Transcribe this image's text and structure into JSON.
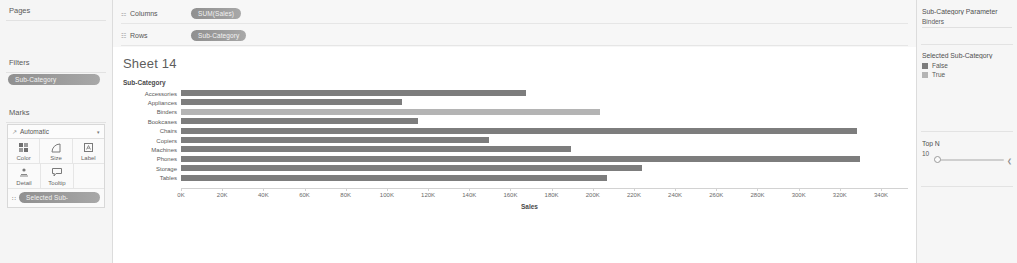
{
  "left_panel": {
    "pages_label": "Pages",
    "filters_label": "Filters",
    "filters_pill": "Sub-Category",
    "marks_label": "Marks",
    "mark_type": "Automatic",
    "mark_type_caret": "▾",
    "mark_type_icon": "↗",
    "mark_buttons": [
      {
        "label": "Color",
        "icon": "color-icon"
      },
      {
        "label": "Size",
        "icon": "size-icon"
      },
      {
        "label": "Label",
        "icon": "label-icon"
      },
      {
        "label": "Detail",
        "icon": "detail-icon"
      },
      {
        "label": "Tooltip",
        "icon": "tooltip-icon"
      }
    ],
    "marks_pill": "Selected Sub-",
    "marks_pill_icon": "∷"
  },
  "shelves": {
    "columns_label": "Columns",
    "columns_pill": "SUM(Sales)",
    "columns_icon": "⚏",
    "rows_label": "Rows",
    "rows_pill": "Sub-Category",
    "rows_icon": "☷",
    "rows_pill_prefix": "∷"
  },
  "viz": {
    "title": "Sheet 14",
    "row_header": "Sub-Category"
  },
  "right_panel": {
    "parameter_title": "Sub-Category Parameter",
    "parameter_value": "Binders",
    "legend_title": "Selected Sub-Category",
    "legend_items": [
      {
        "label": "False",
        "color": "#7d7d7d"
      },
      {
        "label": "True",
        "color": "#b4b4b4"
      }
    ],
    "topn_title": "Top N",
    "topn_value": "10",
    "topn_arrow": "❮"
  },
  "colors": {
    "bar_false": "#7d7d7d",
    "bar_true": "#b4b4b4",
    "panel_bg": "#f5f5f5",
    "canvas_bg": "#ffffff",
    "pill_bg": "#9a9a9a"
  },
  "chart_data": {
    "type": "bar",
    "title": "Sheet 14",
    "orientation": "horizontal",
    "xlabel": "Sales",
    "ylabel": "Sub-Category",
    "xlim": [
      0,
      340000
    ],
    "grid": false,
    "legend_position": "right",
    "tick_labels": [
      "0K",
      "20K",
      "40K",
      "60K",
      "80K",
      "100K",
      "120K",
      "140K",
      "160K",
      "180K",
      "200K",
      "220K",
      "240K",
      "260K",
      "280K",
      "300K",
      "320K",
      "340K"
    ],
    "tick_values": [
      0,
      20000,
      40000,
      60000,
      80000,
      100000,
      120000,
      140000,
      160000,
      180000,
      200000,
      220000,
      240000,
      260000,
      280000,
      300000,
      320000,
      340000
    ],
    "categories": [
      "Accessories",
      "Appliances",
      "Binders",
      "Bookcases",
      "Chairs",
      "Copiers",
      "Machines",
      "Phones",
      "Storage",
      "Tables"
    ],
    "values": [
      167380,
      107532,
      203413,
      114880,
      328449,
      149528,
      189239,
      330007,
      223844,
      206966
    ],
    "selected": [
      false,
      false,
      true,
      false,
      false,
      false,
      false,
      false,
      false,
      false
    ],
    "series": [
      {
        "name": "SUM(Sales)",
        "values": [
          167380,
          107532,
          203413,
          114880,
          328449,
          149528,
          189239,
          330007,
          223844,
          206966
        ]
      }
    ]
  }
}
